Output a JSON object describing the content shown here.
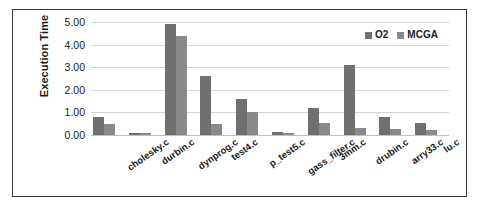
{
  "chart_data": {
    "type": "bar",
    "title": "",
    "xlabel": "",
    "ylabel": "Execution Time",
    "ylim": [
      0,
      5
    ],
    "y_ticks": [
      "0.00",
      "1.00",
      "2.00",
      "3.00",
      "4.00",
      "5.00"
    ],
    "grid": true,
    "legend_position": "top-right",
    "categories": [
      "cholesky.c",
      "durbin.c",
      "dynprog.c",
      "test4.c",
      "p_test5.c",
      "gass_filter.c",
      "3mm.c",
      "drubin.c",
      "arry33.c",
      "lu.c"
    ],
    "series": [
      {
        "name": "O2",
        "color": "#6f6f6f",
        "values": [
          0.8,
          0.1,
          4.92,
          2.6,
          1.6,
          0.12,
          1.18,
          3.1,
          0.8,
          0.55
        ]
      },
      {
        "name": "MCGA",
        "color": "#8a8a8a",
        "values": [
          0.5,
          0.1,
          4.38,
          0.48,
          1.0,
          0.1,
          0.55,
          0.3,
          0.28,
          0.22
        ]
      }
    ]
  },
  "colors": {
    "series_o2": "#6f6f6f",
    "series_mcga": "#8a8a8a",
    "gridline": "#d4d4d4",
    "border": "#3a3a3a",
    "text": "#1a1a1a",
    "background": "#ffffff"
  }
}
